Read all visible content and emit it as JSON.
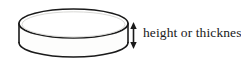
{
  "figure": {
    "kind": "geometry-diagram",
    "shape_name": "disk-cylinder",
    "background_color": "#ffffff",
    "stroke_color": "#1a1a1a",
    "fill_color": "#fdfdfc",
    "annotation": {
      "label": "height or thickness",
      "text_color": "#1a1a1a",
      "arrow": {
        "name": "double-headed-vertical-arrow",
        "direction": "both",
        "x": 133,
        "y_top": 23,
        "y_bottom": 48,
        "color": "#1a1a1a"
      }
    },
    "geometry": {
      "top_ellipse": {
        "cx": 73.5,
        "cy": 23.5,
        "rx": 54.5,
        "ry": 14.5
      },
      "bottom_ellipse": {
        "cx": 73.5,
        "cy": 42.5,
        "rx": 54.5,
        "ry": 14.5
      },
      "left_wall_x": 19,
      "right_wall_x": 128,
      "wall_top_y": 23.5,
      "wall_bottom_y": 42.5
    }
  }
}
